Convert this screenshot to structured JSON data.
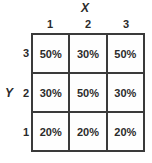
{
  "chart_data": {
    "type": "heatmap",
    "title": "",
    "xlabel": "X",
    "ylabel": "Y",
    "x_tick_labels": [
      "1",
      "2",
      "3"
    ],
    "y_tick_labels": [
      "3",
      "2",
      "1"
    ],
    "grid": true,
    "legend": "none",
    "cell_unit": "%",
    "rows": [
      {
        "y": "3",
        "cells": [
          "50%",
          "30%",
          "50%"
        ]
      },
      {
        "y": "2",
        "cells": [
          "30%",
          "50%",
          "30%"
        ]
      },
      {
        "y": "1",
        "cells": [
          "20%",
          "20%",
          "20%"
        ]
      }
    ],
    "values": [
      [
        50,
        30,
        50
      ],
      [
        30,
        50,
        30
      ],
      [
        20,
        20,
        20
      ]
    ],
    "colors": {
      "grid_line": "#3a3a3a",
      "cell_background": "#fefefe",
      "text": "#2b2b2b",
      "page_background": "#ffffff"
    }
  }
}
